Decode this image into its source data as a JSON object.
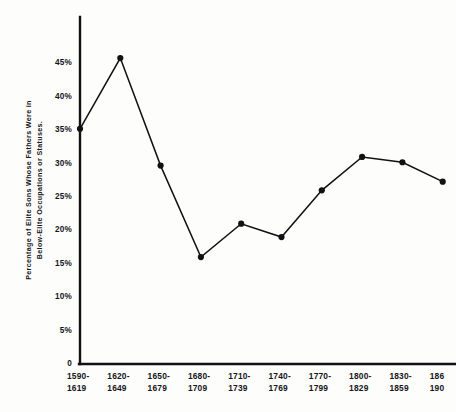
{
  "chart_data": {
    "type": "line",
    "title": "",
    "xlabel": "",
    "ylabel": "Percentage of Elite Sons Whose Fathers Were in Below-Elite Occupations or Statuses.",
    "ylabel_line1": "Percentage of Elite Sons Whose Fathers Were in",
    "ylabel_line2": "Below-Elite Occupations or Statuses.",
    "categories": [
      "1590-1619",
      "1620-1649",
      "1650-1679",
      "1680-1709",
      "1710-1739",
      "1740-1769",
      "1770-1799",
      "1800-1829",
      "1830-1859",
      "1860-1909"
    ],
    "x_tick_labels": [
      {
        "top": "1590-",
        "bottom": "1619"
      },
      {
        "top": "1620-",
        "bottom": "1649"
      },
      {
        "top": "1650-",
        "bottom": "1679"
      },
      {
        "top": "1680-",
        "bottom": "1709"
      },
      {
        "top": "1710-",
        "bottom": "1739"
      },
      {
        "top": "1740-",
        "bottom": "1769"
      },
      {
        "top": "1770-",
        "bottom": "1799"
      },
      {
        "top": "1800-",
        "bottom": "1829"
      },
      {
        "top": "1830-",
        "bottom": "1859"
      },
      {
        "top": "186",
        "bottom": "190"
      }
    ],
    "values": [
      35.2,
      45.8,
      29.7,
      16.0,
      21.0,
      19.0,
      26.0,
      31.0,
      30.2,
      27.3
    ],
    "y_tick_labels": [
      "0",
      "5%",
      "10%",
      "15%",
      "20%",
      "25%",
      "30%",
      "35%",
      "40%",
      "45%"
    ],
    "y_tick_values": [
      0,
      5,
      10,
      15,
      20,
      25,
      30,
      35,
      40,
      45
    ],
    "ylim": [
      0,
      50
    ],
    "grid": false,
    "legend": "none",
    "marker": "filled-circle",
    "line_color": "#111114",
    "axis_color": "#111114",
    "background_color": "#fdfdfc"
  }
}
